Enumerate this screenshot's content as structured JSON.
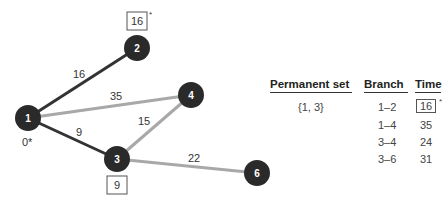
{
  "diagram": {
    "nodes": [
      {
        "id": "1",
        "label": "1",
        "x": 28,
        "y": 118,
        "annotation": "0*"
      },
      {
        "id": "2",
        "label": "2",
        "x": 137,
        "y": 48,
        "annotation": "16"
      },
      {
        "id": "3",
        "label": "3",
        "x": 117,
        "y": 159,
        "annotation": "9"
      },
      {
        "id": "4",
        "label": "4",
        "x": 191,
        "y": 95
      },
      {
        "id": "6",
        "label": "6",
        "x": 257,
        "y": 173
      }
    ],
    "edges": [
      {
        "from": "1",
        "to": "2",
        "weight": "16",
        "style": "dark"
      },
      {
        "from": "1",
        "to": "4",
        "weight": "35",
        "style": "light"
      },
      {
        "from": "1",
        "to": "3",
        "weight": "9",
        "style": "dark"
      },
      {
        "from": "3",
        "to": "4",
        "weight": "15",
        "style": "light"
      },
      {
        "from": "3",
        "to": "6",
        "weight": "22",
        "style": "light"
      }
    ],
    "node2_box": "16",
    "node2_star": "*",
    "node3_box": "9",
    "node1_label": "0*",
    "colors": {
      "node": "#2a2a2a",
      "dark_edge": "#333333",
      "light_edge": "#a8a8a8",
      "node_text": "#ffffff"
    }
  },
  "table": {
    "headers": [
      "Permanent set",
      "Branch",
      "Time"
    ],
    "permanent_set": "{1, 3}",
    "rows": [
      {
        "branch": "1–2",
        "time": "16",
        "boxed": true,
        "star": "*"
      },
      {
        "branch": "1–4",
        "time": "35"
      },
      {
        "branch": "3–4",
        "time": "24"
      },
      {
        "branch": "3–6",
        "time": "31"
      }
    ]
  }
}
